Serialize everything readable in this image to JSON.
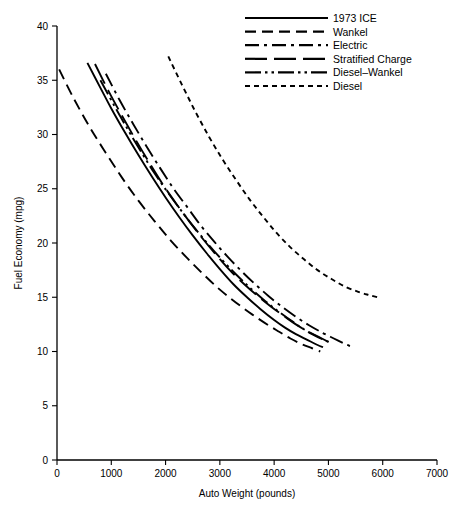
{
  "chart_data": {
    "type": "line",
    "title": "",
    "subtitle": "",
    "xlabel": "Auto Weight (pounds)",
    "ylabel": "Fuel Economy (mpg)",
    "xlim": [
      0,
      7000
    ],
    "ylim": [
      0,
      40
    ],
    "xticks": [
      0,
      1000,
      2000,
      3000,
      4000,
      5000,
      6000,
      7000
    ],
    "yticks": [
      0,
      5,
      10,
      15,
      20,
      25,
      30,
      35,
      40
    ],
    "xtick_labels": [
      "0",
      "1000",
      "2000",
      "3000",
      "4000",
      "5000",
      "6000",
      "7000"
    ],
    "ytick_labels": [
      "0",
      "5",
      "10",
      "15",
      "20",
      "25",
      "30",
      "35",
      "40"
    ],
    "grid": false,
    "legend_position": "top-right",
    "accent_color": "#000000",
    "background_color": "#ffffff",
    "series": [
      {
        "name": "1973 ICE",
        "style": "solid",
        "dasharray": "none",
        "points": [
          [
            560,
            36.6
          ],
          [
            800,
            34.3
          ],
          [
            1000,
            32.4
          ],
          [
            1250,
            30.2
          ],
          [
            1500,
            28.1
          ],
          [
            1750,
            26.1
          ],
          [
            2000,
            24.2
          ],
          [
            2250,
            22.4
          ],
          [
            2500,
            20.7
          ],
          [
            2750,
            19.1
          ],
          [
            3000,
            17.6
          ],
          [
            3250,
            16.2
          ],
          [
            3500,
            15.0
          ],
          [
            3750,
            13.9
          ],
          [
            4000,
            12.9
          ],
          [
            4200,
            12.2
          ],
          [
            4400,
            11.6
          ],
          [
            4600,
            11.1
          ],
          [
            4800,
            10.6
          ],
          [
            4900,
            10.4
          ]
        ]
      },
      {
        "name": "Wankel",
        "style": "dashed-long",
        "dasharray": "11,6",
        "points": [
          [
            40,
            36.0
          ],
          [
            300,
            33.4
          ],
          [
            600,
            30.7
          ],
          [
            900,
            28.3
          ],
          [
            1200,
            26.0
          ],
          [
            1500,
            23.9
          ],
          [
            1800,
            22.0
          ],
          [
            2100,
            20.2
          ],
          [
            2400,
            18.6
          ],
          [
            2700,
            17.1
          ],
          [
            3000,
            15.7
          ],
          [
            3300,
            14.5
          ],
          [
            3600,
            13.4
          ],
          [
            3900,
            12.4
          ],
          [
            4100,
            11.8
          ],
          [
            4300,
            11.2
          ],
          [
            4500,
            10.7
          ],
          [
            4700,
            10.3
          ],
          [
            4850,
            10.0
          ]
        ]
      },
      {
        "name": "Electric",
        "style": "dash-dot",
        "dasharray": "14,5,3,5",
        "points": [
          [
            900,
            35.6
          ],
          [
            1150,
            33.2
          ],
          [
            1400,
            31.0
          ],
          [
            1650,
            28.9
          ],
          [
            1900,
            26.9
          ],
          [
            2150,
            25.0
          ],
          [
            2400,
            23.3
          ],
          [
            2650,
            21.6
          ],
          [
            2900,
            20.1
          ],
          [
            3150,
            18.7
          ],
          [
            3400,
            17.4
          ],
          [
            3650,
            16.2
          ],
          [
            3900,
            15.1
          ],
          [
            4150,
            14.1
          ],
          [
            4400,
            13.2
          ],
          [
            4650,
            12.4
          ],
          [
            4900,
            11.7
          ],
          [
            5100,
            11.2
          ],
          [
            5300,
            10.7
          ],
          [
            5400,
            10.5
          ]
        ]
      },
      {
        "name": "Stratified Charge",
        "style": "dash-gap-dash",
        "dasharray": "22,7",
        "points": [
          [
            700,
            36.5
          ],
          [
            950,
            34.0
          ],
          [
            1200,
            31.7
          ],
          [
            1450,
            29.5
          ],
          [
            1700,
            27.4
          ],
          [
            1950,
            25.4
          ],
          [
            2200,
            23.6
          ],
          [
            2450,
            21.9
          ],
          [
            2700,
            20.3
          ],
          [
            2950,
            18.8
          ],
          [
            3200,
            17.4
          ],
          [
            3450,
            16.2
          ],
          [
            3700,
            15.1
          ],
          [
            3950,
            14.1
          ],
          [
            4200,
            13.2
          ],
          [
            4400,
            12.5
          ],
          [
            4600,
            11.9
          ],
          [
            4800,
            11.4
          ],
          [
            5000,
            10.9
          ],
          [
            5100,
            10.7
          ]
        ]
      },
      {
        "name": "Diesel–Wankel",
        "style": "dash-dot-dot",
        "dasharray": "16,4,2.5,4,2.5,4",
        "points": [
          [
            800,
            35.0
          ],
          [
            1050,
            32.7
          ],
          [
            1300,
            30.5
          ],
          [
            1550,
            28.4
          ],
          [
            1800,
            26.4
          ],
          [
            2050,
            24.6
          ],
          [
            2300,
            22.9
          ],
          [
            2550,
            21.3
          ],
          [
            2800,
            19.8
          ],
          [
            3050,
            18.4
          ],
          [
            3300,
            17.1
          ],
          [
            3550,
            15.9
          ],
          [
            3800,
            14.8
          ],
          [
            4050,
            13.8
          ],
          [
            4300,
            12.9
          ],
          [
            4500,
            12.2
          ],
          [
            4700,
            11.6
          ],
          [
            4900,
            11.1
          ],
          [
            5050,
            10.8
          ]
        ]
      },
      {
        "name": "Diesel",
        "style": "dotted-short",
        "dasharray": "5,4",
        "points": [
          [
            2050,
            37.2
          ],
          [
            2300,
            34.6
          ],
          [
            2550,
            32.1
          ],
          [
            2800,
            29.8
          ],
          [
            3050,
            27.7
          ],
          [
            3300,
            25.8
          ],
          [
            3550,
            24.0
          ],
          [
            3800,
            22.4
          ],
          [
            4050,
            20.9
          ],
          [
            4300,
            19.6
          ],
          [
            4550,
            18.5
          ],
          [
            4800,
            17.5
          ],
          [
            5050,
            16.7
          ],
          [
            5300,
            16.0
          ],
          [
            5550,
            15.5
          ],
          [
            5750,
            15.2
          ],
          [
            5900,
            15.0
          ]
        ]
      }
    ],
    "legend": [
      {
        "label": "1973 ICE",
        "dasharray": "none"
      },
      {
        "label": "Wankel",
        "dasharray": "11,6"
      },
      {
        "label": "Electric",
        "dasharray": "14,5,3,5"
      },
      {
        "label": "Stratified Charge",
        "dasharray": "22,7"
      },
      {
        "label": "Diesel–Wankel",
        "dasharray": "16,4,2.5,4,2.5,4"
      },
      {
        "label": "Diesel",
        "dasharray": "5,4"
      }
    ]
  }
}
